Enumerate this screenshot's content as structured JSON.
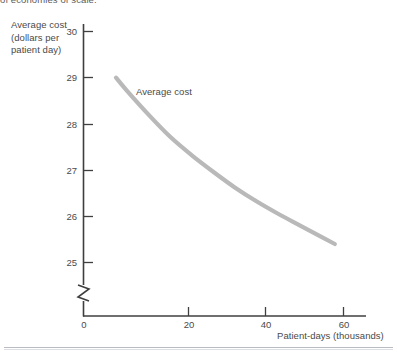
{
  "caption": {
    "top_text_clipped": "of economies of scale."
  },
  "chart_data": {
    "type": "line",
    "title": "",
    "subtitle": "",
    "ylabel": "Average cost (dollars per patient day)",
    "ylabel_line1": "Average cost",
    "ylabel_line2": "(dollars per",
    "ylabel_line3": "patient day)",
    "xlabel": "Patient-days (thousands)",
    "xlim": [
      0,
      65
    ],
    "ylim": [
      24.6,
      30.2
    ],
    "yticks": [
      25,
      26,
      27,
      28,
      29,
      30
    ],
    "ytick_labels": [
      "25",
      "26",
      "27",
      "28",
      "29",
      "30"
    ],
    "xticks": [
      0,
      20,
      40,
      60
    ],
    "xtick_labels": [
      "0",
      "20",
      "40",
      "60"
    ],
    "grid": false,
    "legend_position": "inline-annotation",
    "y_axis_break": true,
    "series": [
      {
        "name": "Average cost",
        "annotation": "Average cost",
        "color": "#b9b9b9",
        "line_width": 4.2,
        "x": [
          7.5,
          10,
          15,
          20,
          25,
          30,
          35,
          40,
          45,
          50,
          55,
          58
        ],
        "y": [
          29.0,
          28.72,
          28.2,
          27.72,
          27.32,
          26.96,
          26.62,
          26.32,
          26.05,
          25.8,
          25.55,
          25.4
        ]
      }
    ]
  },
  "axes": {
    "y_break_symbol": "axis-break",
    "tick_color": "#4a4a4a",
    "axis_color": "#3f3f3f"
  }
}
